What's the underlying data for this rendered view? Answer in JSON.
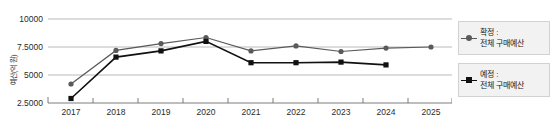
{
  "chart_data": {
    "type": "line",
    "title": "",
    "xlabel": "",
    "ylabel": "예산(억 원)",
    "categories": [
      "2017",
      "2018",
      "2019",
      "2020",
      "2021",
      "2022",
      "2023",
      "2024",
      "2025"
    ],
    "x": [
      2017,
      2018,
      2019,
      2020,
      2021,
      2022,
      2023,
      2024,
      2025
    ],
    "ylim": [
      2500,
      10000
    ],
    "yticks": [
      2500,
      5000,
      7500,
      10000
    ],
    "ytick_labels": [
      "2.5000",
      "5000",
      "7.5000",
      "10000"
    ],
    "grid": true,
    "legend_position": "right",
    "series": [
      {
        "name": "확정 : 전체 구매예산",
        "name_line1": "확정 :",
        "name_line2": "전체 구매예산",
        "color": "#5a5a5a",
        "marker": "circle",
        "values": [
          4200,
          7200,
          7800,
          8350,
          7150,
          7600,
          7100,
          7400,
          7500
        ]
      },
      {
        "name": "예정 : 전체 구매예산",
        "name_line1": "예정 :",
        "name_line2": "전체 구매예산",
        "color": "#111111",
        "marker": "square",
        "values": [
          2900,
          6600,
          7150,
          8000,
          6100,
          6100,
          6150,
          5900,
          null
        ]
      }
    ]
  },
  "axis": {
    "y_title": "예산(억 원)",
    "y_labels": [
      "10000",
      "7.5000",
      "5000",
      "2.5000"
    ],
    "x_labels": [
      "2017",
      "2018",
      "2019",
      "2020",
      "2021",
      "2022",
      "2023",
      "2024",
      "2025"
    ]
  },
  "legend": {
    "items": [
      {
        "line1": "확정 :",
        "line2": "전체 구매예산",
        "color": "#5a5a5a",
        "marker": "circle-marker"
      },
      {
        "line1": "예정 :",
        "line2": "전체 구매예산",
        "color": "#111111",
        "marker": "square-marker"
      }
    ]
  },
  "colors": {
    "confirmed": "#5a5a5a",
    "planned": "#111111",
    "grid": "#a8a8a8",
    "axis": "#6e6e6e",
    "legend_bg": "#f2f2f2",
    "background": "#ffffff"
  }
}
